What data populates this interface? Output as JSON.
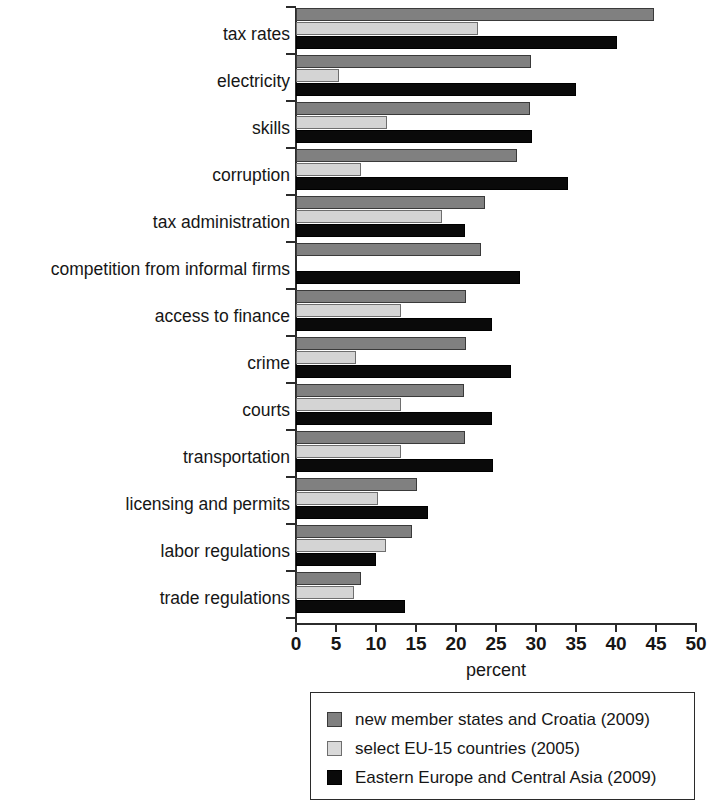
{
  "chart_data": {
    "type": "bar",
    "orientation": "horizontal",
    "title": "",
    "xlabel": "percent",
    "ylabel": "",
    "xlim": [
      0,
      50
    ],
    "xticks": [
      0,
      5,
      10,
      15,
      20,
      25,
      30,
      35,
      40,
      45,
      50
    ],
    "xtick_labels": [
      "0",
      "5",
      "10",
      "15",
      "20",
      "25",
      "30",
      "35",
      "40",
      "45",
      "50"
    ],
    "grid": false,
    "legend_position": "bottom",
    "categories": [
      "tax rates",
      "electricity",
      "skills",
      "corruption",
      "tax administration",
      "competition from informal firms",
      "access to finance",
      "crime",
      "courts",
      "transportation",
      "licensing and permits",
      "labor regulations",
      "trade regulations"
    ],
    "series": [
      {
        "name": "new member states and Croatia (2009)",
        "color": "#808080",
        "values": [
          44.7,
          29.4,
          29.3,
          27.6,
          23.6,
          23.1,
          21.2,
          21.2,
          21.0,
          21.1,
          15.1,
          14.5,
          8.1
        ]
      },
      {
        "name": "select EU-15 countries (2005)",
        "color": "#d4d4d4",
        "values": [
          22.8,
          5.4,
          11.4,
          8.1,
          18.2,
          0,
          13.1,
          7.5,
          13.1,
          13.1,
          10.2,
          11.3,
          7.3
        ]
      },
      {
        "name": "Eastern Europe and Central Asia (2009)",
        "color": "#0a0a0a",
        "values": [
          40.1,
          35.0,
          29.5,
          34.0,
          21.1,
          28.0,
          24.5,
          26.9,
          24.5,
          24.6,
          16.5,
          10.0,
          13.6
        ]
      }
    ]
  },
  "axis": {
    "x_title": "percent"
  },
  "legend": {
    "items": [
      {
        "label": "new member states and Croatia (2009)",
        "swatch": "#808080"
      },
      {
        "label": "select EU-15 countries (2005)",
        "swatch": "#d9d9d9"
      },
      {
        "label": "Eastern Europe and Central Asia (2009)",
        "swatch": "#0a0a0a"
      }
    ]
  }
}
